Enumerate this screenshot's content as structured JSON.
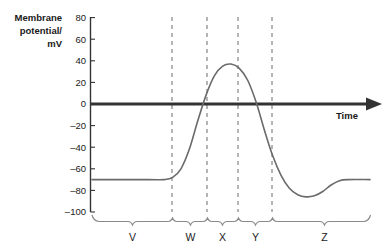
{
  "chart_data": {
    "type": "line",
    "title": "",
    "xlabel": "Time",
    "ylabel": "Membrane potential/ mV",
    "ylabel_lines": [
      "Membrane",
      "potential/",
      "mV"
    ],
    "ylim": [
      -100,
      80
    ],
    "yticks": [
      80,
      60,
      40,
      20,
      0,
      -20,
      -40,
      -60,
      -80,
      -100
    ],
    "ytick_labels": [
      "80",
      "60",
      "40",
      "20",
      "0",
      "–20",
      "–40",
      "–60",
      "–80",
      "–100"
    ],
    "grid": false,
    "legend": null,
    "resting_potential": -70,
    "peak_potential": 37,
    "hyperpolarization_minimum": -86,
    "threshold_crossing": 0,
    "series": [
      {
        "name": "Membrane potential",
        "color": "#6a6a6a",
        "points": [
          {
            "x": 0.0,
            "y": -70
          },
          {
            "x": 0.2,
            "y": -70
          },
          {
            "x": 0.26,
            "y": -70
          },
          {
            "x": 0.29,
            "y": -68
          },
          {
            "x": 0.32,
            "y": -60
          },
          {
            "x": 0.35,
            "y": -42
          },
          {
            "x": 0.38,
            "y": -16
          },
          {
            "x": 0.41,
            "y": 8
          },
          {
            "x": 0.44,
            "y": 26
          },
          {
            "x": 0.47,
            "y": 35
          },
          {
            "x": 0.5,
            "y": 37
          },
          {
            "x": 0.53,
            "y": 33
          },
          {
            "x": 0.56,
            "y": 22
          },
          {
            "x": 0.59,
            "y": 2
          },
          {
            "x": 0.62,
            "y": -24
          },
          {
            "x": 0.65,
            "y": -48
          },
          {
            "x": 0.68,
            "y": -66
          },
          {
            "x": 0.71,
            "y": -78
          },
          {
            "x": 0.74,
            "y": -84
          },
          {
            "x": 0.77,
            "y": -86
          },
          {
            "x": 0.8,
            "y": -85
          },
          {
            "x": 0.83,
            "y": -81
          },
          {
            "x": 0.86,
            "y": -75
          },
          {
            "x": 0.89,
            "y": -71
          },
          {
            "x": 0.92,
            "y": -70
          },
          {
            "x": 1.0,
            "y": -70
          }
        ]
      }
    ],
    "markers": {
      "name": "dashed-phase-dividers",
      "x_fractions": [
        0.275,
        0.395,
        0.5,
        0.615
      ]
    },
    "regions": [
      {
        "label": "V",
        "start": 0.0,
        "end": 0.275
      },
      {
        "label": "W",
        "start": 0.275,
        "end": 0.395
      },
      {
        "label": "X",
        "start": 0.395,
        "end": 0.5
      },
      {
        "label": "Y",
        "start": 0.5,
        "end": 0.615
      },
      {
        "label": "Z",
        "start": 0.615,
        "end": 1.0
      }
    ]
  },
  "axes": {
    "y_title_line1": "Membrane",
    "y_title_line2": "potential/",
    "y_title_line3": "mV",
    "x_title": "Time"
  },
  "ticks": {
    "t80": "80",
    "t60": "60",
    "t40": "40",
    "t20": "20",
    "t0": "0",
    "tm20": "–20",
    "tm40": "–40",
    "tm60": "–60",
    "tm80": "–80",
    "tm100": "–100"
  },
  "regions": {
    "v": "V",
    "w": "W",
    "x": "X",
    "y": "Y",
    "z": "Z"
  },
  "colors": {
    "axis": "#333333",
    "curve": "#6a6a6a",
    "dashed": "#6a6a6a",
    "brace": "#8a8a8a",
    "text": "#1a1a1a"
  }
}
